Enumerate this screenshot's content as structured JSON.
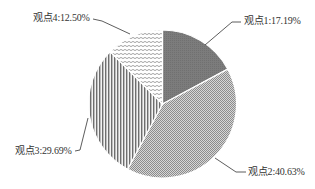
{
  "chart_data": {
    "type": "pie",
    "title": "",
    "categories": [
      "观点1",
      "观点2",
      "观点3",
      "观点4"
    ],
    "values": [
      17.19,
      40.63,
      29.69,
      12.5
    ],
    "unit": "%",
    "labels": [
      "观点1:17.19%",
      "观点2:40.63%",
      "观点3:29.69%",
      "观点4:12.50%"
    ],
    "start_angle_deg": 0,
    "direction": "clockwise",
    "legend": "none (leader-line labels)",
    "fills": [
      {
        "category": "观点1",
        "pattern": "solid dark gray",
        "color": "#7a7a7a"
      },
      {
        "category": "观点2",
        "pattern": "fine crosshatch/checker",
        "color": "#a8a8a8"
      },
      {
        "category": "观点3",
        "pattern": "vertical lines",
        "color": "#6e6e6e"
      },
      {
        "category": "观点4",
        "pattern": "wavy horizontal lines",
        "color": "#9a9a9a"
      }
    ]
  },
  "labels": {
    "slice1": "观点1:17.19%",
    "slice2": "观点2:40.63%",
    "slice3": "观点3:29.69%",
    "slice4": "观点4:12.50%"
  }
}
